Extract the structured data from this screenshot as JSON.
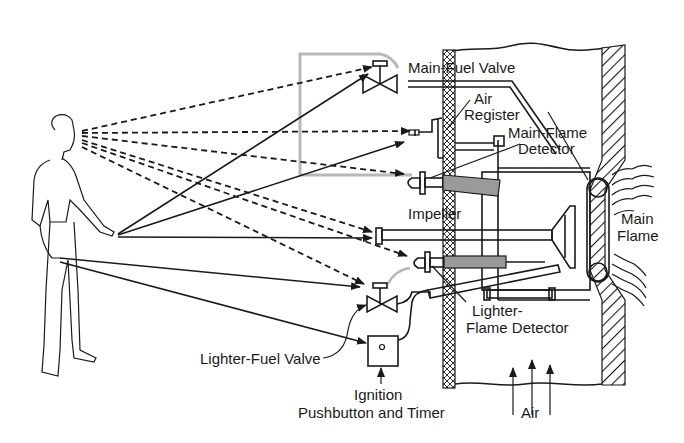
{
  "labels": {
    "main_fuel_valve": "Main-Fuel Valve",
    "air_register_1": "Air",
    "air_register_2": "Register",
    "main_flame_detector_1": "Main-Flame",
    "main_flame_detector_2": "Detector",
    "impeller": "Impeller",
    "main_flame_1": "Main",
    "main_flame_2": "Flame",
    "lighter_flame_detector_1": "Lighter-",
    "lighter_flame_detector_2": "Flame Detector",
    "lighter_fuel_valve": "Lighter-Fuel Valve",
    "ignition_1": "Ignition",
    "ignition_2": "Pushbutton and Timer",
    "air": "Air"
  },
  "colors": {
    "ink": "#1a1a1a",
    "gray_outline": "#b8b8b8",
    "shading": "#9a9a9a",
    "background": "#ffffff"
  }
}
